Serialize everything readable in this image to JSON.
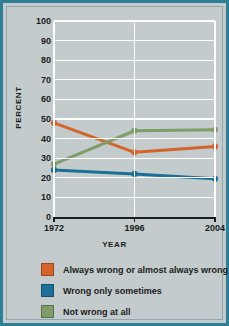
{
  "chart_data": {
    "type": "line",
    "title": "",
    "xlabel": "YEAR",
    "ylabel": "PERCENT",
    "categories": [
      "1972",
      "1996",
      "2004"
    ],
    "x": [
      1972,
      1996,
      2004
    ],
    "ylim": [
      0,
      100
    ],
    "xlim": [
      1972,
      2004
    ],
    "y_ticks": [
      100,
      90,
      80,
      70,
      60,
      50,
      40,
      30,
      20,
      10,
      0
    ],
    "grid": "horizontal-and-vertical-white",
    "legend_position": "below",
    "series": [
      {
        "name": "Always wrong or almost always wrong",
        "color": "#d4642a",
        "values": [
          48,
          33,
          36
        ]
      },
      {
        "name": "Wrong only sometimes",
        "color": "#1c6f96",
        "values": [
          24,
          22,
          19.5
        ]
      },
      {
        "name": "Not wrong at all",
        "color": "#7f9c69",
        "values": [
          27,
          44,
          44.5
        ]
      }
    ]
  },
  "axes": {
    "y_title": "PERCENT",
    "x_title": "YEAR",
    "y_tick_labels": [
      "100",
      "90",
      "80",
      "70",
      "60",
      "50",
      "40",
      "30",
      "20",
      "10",
      "0"
    ],
    "x_tick_labels": [
      "1972",
      "1996",
      "2004"
    ]
  },
  "legend": {
    "items": [
      {
        "label": "Always wrong or almost always wrong",
        "color": "#d4642a"
      },
      {
        "label": "Wrong only sometimes",
        "color": "#1c6f96"
      },
      {
        "label": "Not wrong at all",
        "color": "#7f9c69"
      }
    ]
  },
  "colors": {
    "frame_border": "#2e7f95",
    "background": "#c3cbcd",
    "gridline": "#ffffff",
    "axis_line": "#1b1b1b",
    "text": "#1b1b1b"
  }
}
